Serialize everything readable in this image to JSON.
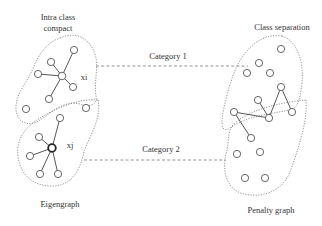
{
  "labels": {
    "intra_class": "Intra class",
    "compact": "compact",
    "class_separation": "Class separation",
    "category1": "Category 1",
    "category2": "Category 2",
    "xi": "xi",
    "xj": "xj",
    "eigengraph": "Eigengraph",
    "penalty_graph": "Penalty graph"
  },
  "colors": {
    "node_stroke": "#555555",
    "edge": "#444444",
    "boundary": "#777777",
    "text": "#333333"
  },
  "eigengraph": {
    "cluster_top": {
      "hub": "xi",
      "hub_pos": [
        62,
        76
      ],
      "neighbors": [
        [
          74,
          50
        ],
        [
          51,
          62
        ],
        [
          38,
          74
        ],
        [
          73,
          87
        ],
        [
          49,
          99
        ]
      ],
      "others": [
        [
          26,
          109
        ],
        [
          86,
          108
        ]
      ]
    },
    "cluster_bottom": {
      "hub": "xj",
      "hub_pos": [
        52,
        148
      ],
      "neighbors": [
        [
          60,
          118
        ],
        [
          39,
          137
        ],
        [
          30,
          156
        ],
        [
          40,
          174
        ],
        [
          58,
          174
        ]
      ]
    }
  },
  "penalty_graph": {
    "class_top_nodes": [
      [
        281,
        49
      ],
      [
        259,
        63
      ],
      [
        247,
        73
      ],
      [
        270,
        73
      ],
      [
        281,
        87
      ],
      [
        258,
        100
      ],
      [
        292,
        112
      ]
    ],
    "class_bottom_nodes": [
      [
        234,
        112
      ],
      [
        269,
        118
      ],
      [
        251,
        138
      ],
      [
        237,
        154
      ],
      [
        260,
        152
      ],
      [
        245,
        178
      ],
      [
        265,
        178
      ]
    ],
    "edges": [
      [
        [
          234,
          112
        ],
        [
          269,
          118
        ]
      ],
      [
        [
          234,
          112
        ],
        [
          251,
          138
        ]
      ],
      [
        [
          258,
          100
        ],
        [
          269,
          118
        ]
      ],
      [
        [
          269,
          118
        ],
        [
          281,
          87
        ]
      ],
      [
        [
          281,
          87
        ],
        [
          292,
          112
        ]
      ]
    ]
  }
}
